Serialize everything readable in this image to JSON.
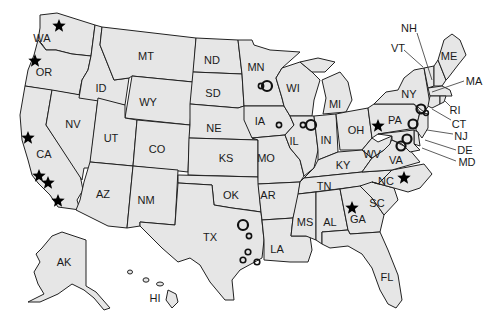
{
  "map": {
    "title": "United States map with site markers",
    "colors": {
      "land": "#e6e6e6",
      "border": "#222222",
      "marker": "#000000",
      "background": "#ffffff"
    },
    "states": [
      {
        "abbr": "WA",
        "x": 42,
        "y": 38
      },
      {
        "abbr": "OR",
        "x": 44,
        "y": 72
      },
      {
        "abbr": "CA",
        "x": 44,
        "y": 154
      },
      {
        "abbr": "NV",
        "x": 73,
        "y": 124
      },
      {
        "abbr": "ID",
        "x": 101,
        "y": 88
      },
      {
        "abbr": "MT",
        "x": 146,
        "y": 56
      },
      {
        "abbr": "WY",
        "x": 148,
        "y": 102
      },
      {
        "abbr": "UT",
        "x": 111,
        "y": 138
      },
      {
        "abbr": "CO",
        "x": 157,
        "y": 149
      },
      {
        "abbr": "AZ",
        "x": 103,
        "y": 194
      },
      {
        "abbr": "NM",
        "x": 146,
        "y": 200
      },
      {
        "abbr": "ND",
        "x": 212,
        "y": 60
      },
      {
        "abbr": "SD",
        "x": 213,
        "y": 93
      },
      {
        "abbr": "NE",
        "x": 214,
        "y": 128
      },
      {
        "abbr": "KS",
        "x": 226,
        "y": 158
      },
      {
        "abbr": "OK",
        "x": 231,
        "y": 195
      },
      {
        "abbr": "TX",
        "x": 210,
        "y": 237
      },
      {
        "abbr": "MN",
        "x": 256,
        "y": 67
      },
      {
        "abbr": "IA",
        "x": 260,
        "y": 121
      },
      {
        "abbr": "MO",
        "x": 266,
        "y": 158
      },
      {
        "abbr": "AR",
        "x": 268,
        "y": 195
      },
      {
        "abbr": "LA",
        "x": 277,
        "y": 249
      },
      {
        "abbr": "WI",
        "x": 293,
        "y": 88
      },
      {
        "abbr": "IL",
        "x": 294,
        "y": 141
      },
      {
        "abbr": "MI",
        "x": 335,
        "y": 104
      },
      {
        "abbr": "IN",
        "x": 326,
        "y": 140
      },
      {
        "abbr": "OH",
        "x": 356,
        "y": 130
      },
      {
        "abbr": "KY",
        "x": 343,
        "y": 165
      },
      {
        "abbr": "TN",
        "x": 324,
        "y": 186
      },
      {
        "abbr": "MS",
        "x": 305,
        "y": 222
      },
      {
        "abbr": "AL",
        "x": 330,
        "y": 222
      },
      {
        "abbr": "GA",
        "x": 358,
        "y": 219
      },
      {
        "abbr": "SC",
        "x": 377,
        "y": 203
      },
      {
        "abbr": "FL",
        "x": 387,
        "y": 277
      },
      {
        "abbr": "NC",
        "x": 386,
        "y": 181
      },
      {
        "abbr": "VA",
        "x": 396,
        "y": 160
      },
      {
        "abbr": "WV",
        "x": 372,
        "y": 154
      },
      {
        "abbr": "PA",
        "x": 395,
        "y": 120
      },
      {
        "abbr": "NY",
        "x": 409,
        "y": 94
      },
      {
        "abbr": "ME",
        "x": 449,
        "y": 56
      },
      {
        "abbr": "AK",
        "x": 64,
        "y": 262
      },
      {
        "abbr": "HI",
        "x": 155,
        "y": 298
      }
    ],
    "callout_labels": [
      {
        "abbr": "NH",
        "x": 409,
        "y": 28,
        "line": [
          417,
          33,
          432,
          80
        ]
      },
      {
        "abbr": "VT",
        "x": 398,
        "y": 48,
        "line": [
          404,
          50,
          423,
          67
        ]
      },
      {
        "abbr": "MA",
        "x": 474,
        "y": 81,
        "line": [
          464,
          81,
          432,
          92
        ]
      },
      {
        "abbr": "RI",
        "x": 455,
        "y": 110,
        "line": [
          450,
          106,
          444,
          100
        ]
      },
      {
        "abbr": "CT",
        "x": 459,
        "y": 124,
        "line": [
          451,
          120,
          432,
          109
        ]
      },
      {
        "abbr": "NJ",
        "x": 461,
        "y": 136,
        "line": [
          453,
          134,
          427,
          130
        ]
      },
      {
        "abbr": "DE",
        "x": 465,
        "y": 150,
        "line": [
          456,
          150,
          425,
          140
        ]
      },
      {
        "abbr": "MD",
        "x": 467,
        "y": 162,
        "line": [
          456,
          161,
          422,
          148
        ]
      }
    ],
    "markers": {
      "stars": [
        {
          "state": "WA",
          "x": 59,
          "y": 26
        },
        {
          "state": "OR",
          "x": 35,
          "y": 61
        },
        {
          "state": "CA",
          "x": 28,
          "y": 138
        },
        {
          "state": "CA",
          "x": 39,
          "y": 176
        },
        {
          "state": "CA",
          "x": 48,
          "y": 183
        },
        {
          "state": "CA",
          "x": 58,
          "y": 201
        },
        {
          "state": "PA",
          "x": 378,
          "y": 126
        },
        {
          "state": "NC",
          "x": 404,
          "y": 178
        },
        {
          "state": "GA",
          "x": 352,
          "y": 208
        }
      ],
      "circles": [
        {
          "state": "MN",
          "x": 267,
          "y": 86,
          "r": 5,
          "w": 2.2
        },
        {
          "state": "MN",
          "x": 261,
          "y": 86,
          "r": 2.6,
          "w": 1.6
        },
        {
          "state": "IA",
          "x": 279,
          "y": 125,
          "r": 2.6,
          "w": 1.6
        },
        {
          "state": "IL",
          "x": 311,
          "y": 125,
          "r": 5,
          "w": 2.2
        },
        {
          "state": "IL",
          "x": 303,
          "y": 125,
          "r": 2.6,
          "w": 1.6
        },
        {
          "state": "TX",
          "x": 243,
          "y": 225,
          "r": 5,
          "w": 2.2
        },
        {
          "state": "TX",
          "x": 249,
          "y": 236,
          "r": 2.6,
          "w": 1.6
        },
        {
          "state": "TX",
          "x": 248,
          "y": 252,
          "r": 2.8,
          "w": 1.6
        },
        {
          "state": "TX",
          "x": 243,
          "y": 260,
          "r": 2.8,
          "w": 1.6
        },
        {
          "state": "TX",
          "x": 257,
          "y": 262,
          "r": 2.8,
          "w": 1.6
        },
        {
          "state": "NY",
          "x": 421,
          "y": 109,
          "r": 4.5,
          "w": 2.2
        },
        {
          "state": "CT",
          "x": 426,
          "y": 113,
          "r": 2.4,
          "w": 1.5
        },
        {
          "state": "NJ",
          "x": 413,
          "y": 124,
          "r": 4.5,
          "w": 2.2
        },
        {
          "state": "MD",
          "x": 407,
          "y": 139,
          "r": 4.5,
          "w": 2.2
        },
        {
          "state": "VA",
          "x": 401,
          "y": 146,
          "r": 4.5,
          "w": 2.2
        }
      ]
    }
  }
}
